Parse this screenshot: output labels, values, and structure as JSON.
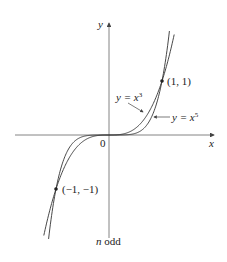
{
  "figure": {
    "caption_var": "n",
    "caption_rest": " odd",
    "axis_x_label": "x",
    "axis_y_label": "y",
    "origin_label": "0",
    "point_pos_label": "(1, 1)",
    "point_neg_label": "(−1, −1)",
    "curve_cubic_label_lhs": "y = x",
    "curve_cubic_exp": "3",
    "curve_quintic_label_lhs": "y = x",
    "curve_quintic_exp": "5",
    "colors": {
      "curve": "#333333",
      "axis": "#555555",
      "text": "#222222"
    }
  },
  "chart_data": {
    "type": "line",
    "title": "",
    "caption": "n odd",
    "xlabel": "x",
    "ylabel": "y",
    "xlim": [
      -1.8,
      2.0
    ],
    "ylim": [
      -1.9,
      2.1
    ],
    "grid": false,
    "series": [
      {
        "name": "y = x^3",
        "x": [
          -1.25,
          -1,
          -0.5,
          0,
          0.5,
          1,
          1.25
        ],
        "y": [
          -1.953,
          -1,
          -0.125,
          0,
          0.125,
          1,
          1.953
        ]
      },
      {
        "name": "y = x^5",
        "x": [
          -1.15,
          -1,
          -0.5,
          0,
          0.5,
          1,
          1.15
        ],
        "y": [
          -2.011,
          -1,
          -0.031,
          0,
          0.031,
          1,
          2.011
        ]
      }
    ],
    "annotations": [
      {
        "text": "(1, 1)",
        "x": 1,
        "y": 1
      },
      {
        "text": "(-1, -1)",
        "x": -1,
        "y": -1
      },
      {
        "text": "0",
        "x": 0,
        "y": 0
      }
    ]
  }
}
